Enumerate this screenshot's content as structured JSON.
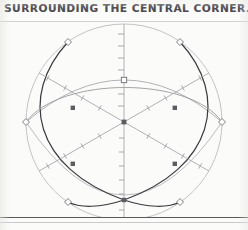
{
  "caption": {
    "text": "SURROUNDING THE CENTRAL CORNER."
  },
  "figure": {
    "background_color": "#fbfbf9",
    "outer_circle_color": "#b9b9bd",
    "arc_dark_color": "#3a3a40",
    "arc_light_color": "#a9a9ae",
    "axis_color": "#a0a0a6",
    "marker_color": "#6e6e74",
    "center_marker_color": "#555559",
    "circle": {
      "center_x": 124,
      "center_y": 104,
      "radius": 98
    },
    "axes": [
      {
        "name": "vertical-axis",
        "angle_deg": 90,
        "tick_count": 9
      },
      {
        "name": "diagonal-axis-ne",
        "angle_deg": 30,
        "tick_count": 9
      },
      {
        "name": "diagonal-axis-nw",
        "angle_deg": 150,
        "tick_count": 9
      }
    ],
    "arcs": [
      {
        "name": "arc-left",
        "weight": "dark"
      },
      {
        "name": "arc-right",
        "weight": "dark"
      },
      {
        "name": "arc-upper",
        "weight": "light"
      },
      {
        "name": "arc-lower",
        "weight": "light"
      }
    ],
    "markers": [
      {
        "name": "vertex-top-left",
        "shape": "diamond",
        "x": 68,
        "y": 24
      },
      {
        "name": "vertex-top-right",
        "shape": "diamond",
        "x": 180,
        "y": 24
      },
      {
        "name": "vertex-left",
        "shape": "diamond",
        "x": 26,
        "y": 104
      },
      {
        "name": "vertex-right",
        "shape": "diamond",
        "x": 222,
        "y": 104
      },
      {
        "name": "vertex-bottom-left",
        "shape": "diamond",
        "x": 68,
        "y": 184
      },
      {
        "name": "vertex-bottom-right",
        "shape": "diamond",
        "x": 180,
        "y": 184
      },
      {
        "name": "node-apex",
        "shape": "square",
        "x": 124,
        "y": 62
      },
      {
        "name": "node-upper-left",
        "shape": "square",
        "x": 73,
        "y": 90
      },
      {
        "name": "node-upper-right",
        "shape": "square",
        "x": 175,
        "y": 90
      },
      {
        "name": "node-lower-left",
        "shape": "square",
        "x": 73,
        "y": 146
      },
      {
        "name": "node-lower-right",
        "shape": "square",
        "x": 175,
        "y": 146
      },
      {
        "name": "node-bottom-crossing",
        "shape": "square",
        "x": 124,
        "y": 182
      },
      {
        "name": "node-center",
        "shape": "square",
        "x": 124,
        "y": 104
      }
    ]
  }
}
